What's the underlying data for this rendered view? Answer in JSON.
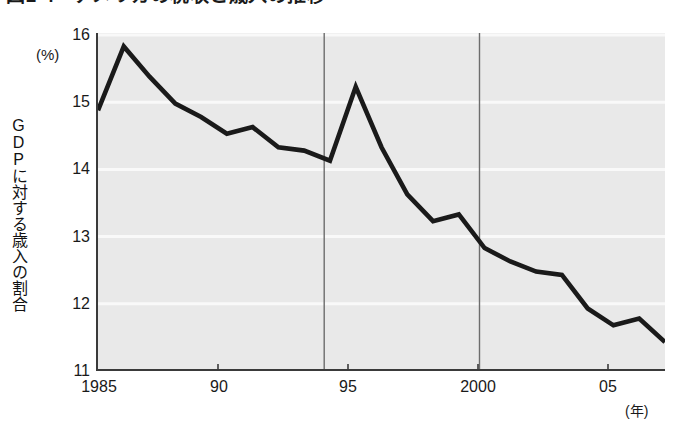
{
  "title": "図1-4　アメリカの税収と歳入の推移",
  "y_unit": "(%)",
  "y_axis_title": "GDPに対する歳入の割合",
  "x_unit": "(年)",
  "y_tick_labels": [
    "16",
    "15",
    "14",
    "13",
    "12",
    "11"
  ],
  "x_tick_labels": [
    "1985",
    "90",
    "95",
    "2000",
    "05"
  ],
  "colors": {
    "plot_background": "#e9e9e9",
    "line": "#1a1a1a",
    "axis": "#3a3a3a",
    "gridline": "#f7f7f7",
    "reference_line": "#6b6b6b",
    "text": "#1a1a1a"
  },
  "chart_data": {
    "type": "line",
    "title": "図1-4　アメリカの税収と歳入の推移",
    "xlabel": "(年)",
    "ylabel": "GDPに対する歳入の割合 (%)",
    "xlim": [
      1985,
      2007
    ],
    "ylim": [
      11,
      16
    ],
    "grid": true,
    "legend": null,
    "x_ticks": [
      1985,
      1990,
      1995,
      2000,
      2005
    ],
    "x_tick_labels": [
      "1985",
      "90",
      "95",
      "2000",
      "05"
    ],
    "y_ticks": [
      11,
      12,
      13,
      14,
      15,
      16
    ],
    "y_tick_labels": [
      "11",
      "12",
      "13",
      "14",
      "15",
      "16"
    ],
    "reference_lines": [
      {
        "x": 1994,
        "orientation": "vertical"
      },
      {
        "x": 2000,
        "orientation": "vertical"
      }
    ],
    "series": [
      {
        "name": "GDPに対する歳入の割合",
        "x": [
          1985,
          1986,
          1987,
          1988,
          1989,
          1990,
          1991,
          1992,
          1993,
          1994,
          1995,
          1996,
          1997,
          1998,
          1999,
          2000,
          2001,
          2002,
          2003,
          2004,
          2005,
          2006,
          2007
        ],
        "values": [
          14.85,
          15.8,
          15.35,
          14.95,
          14.75,
          14.5,
          14.6,
          14.3,
          14.25,
          14.1,
          15.2,
          14.3,
          13.6,
          13.2,
          13.3,
          12.8,
          12.6,
          12.45,
          12.4,
          11.9,
          11.65,
          11.75,
          11.4
        ]
      }
    ]
  }
}
